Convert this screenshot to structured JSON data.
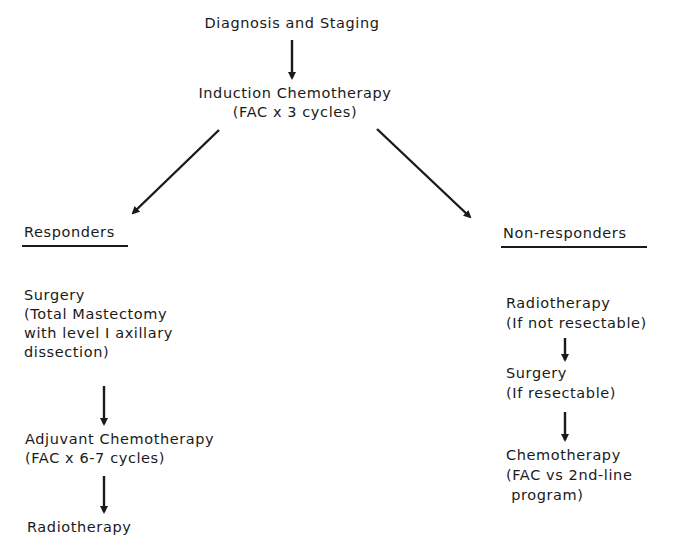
{
  "diagram": {
    "top": {
      "diagnosis": "Diagnosis and Staging",
      "induction_line1": "Induction Chemotherapy",
      "induction_line2": "(FAC x 3 cycles)"
    },
    "responders": {
      "heading": "Responders",
      "steps": [
        {
          "lines": [
            "Surgery",
            "(Total Mastectomy",
            "with level I axillary",
            "dissection)"
          ]
        },
        {
          "lines": [
            "Adjuvant Chemotherapy",
            "(FAC x 6-7 cycles)"
          ]
        },
        {
          "lines": [
            "Radiotherapy"
          ]
        }
      ]
    },
    "non_responders": {
      "heading": "Non-responders",
      "steps": [
        {
          "lines": [
            "Radiotherapy",
            "(If not resectable)"
          ]
        },
        {
          "lines": [
            "Surgery",
            "(If resectable)"
          ]
        },
        {
          "lines": [
            "Chemotherapy",
            "(FAC vs 2nd-line",
            " program)"
          ]
        }
      ]
    },
    "arrows": [
      {
        "id": "diagnosis-to-induction",
        "x1": 292,
        "y1": 40,
        "x2": 292,
        "y2": 78
      },
      {
        "id": "induction-to-responders",
        "x1": 219,
        "y1": 130,
        "x2": 133,
        "y2": 213
      },
      {
        "id": "induction-to-nonresponders",
        "x1": 377,
        "y1": 129,
        "x2": 470,
        "y2": 217
      },
      {
        "id": "surgery-to-adjuvant",
        "x1": 104,
        "y1": 386,
        "x2": 104,
        "y2": 424
      },
      {
        "id": "adjuvant-to-radiotherapy",
        "x1": 104,
        "y1": 476,
        "x2": 104,
        "y2": 512
      },
      {
        "id": "radio-to-surgery",
        "x1": 565,
        "y1": 338,
        "x2": 565,
        "y2": 360
      },
      {
        "id": "surgery-to-chemo",
        "x1": 565,
        "y1": 412,
        "x2": 565,
        "y2": 440
      }
    ]
  }
}
